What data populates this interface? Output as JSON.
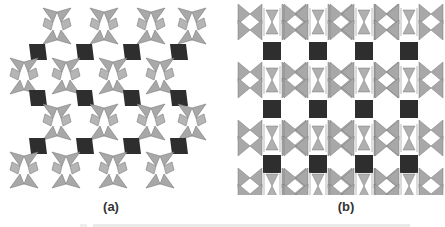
{
  "figure": {
    "panels": [
      {
        "id": "a",
        "label": "(a)",
        "description": "polyhedral framework projection with dark rhombic octahedra and light gray tetrahedra pairs"
      },
      {
        "id": "b",
        "label": "(b)",
        "description": "polyhedral framework projection with dark square octahedra columns and light gray tetrahedra"
      }
    ],
    "colors": {
      "octahedra": "#2e2e2e",
      "tetrahedra": "#a8a8a8",
      "tetrahedra_edge": "#7a7a7a",
      "background": "#ffffff"
    },
    "caption": ""
  }
}
